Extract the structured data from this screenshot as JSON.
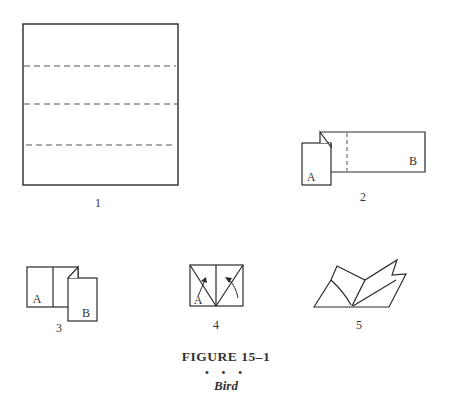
{
  "figure": {
    "title": "FIGURE 15–1",
    "separator": "• • •",
    "subtitle": "Bird"
  },
  "steps": [
    {
      "number": "1",
      "labels": []
    },
    {
      "number": "2",
      "labels": [
        "A",
        "B"
      ]
    },
    {
      "number": "3",
      "labels": [
        "A",
        "B"
      ]
    },
    {
      "number": "4",
      "labels": [
        "A"
      ]
    },
    {
      "number": "5",
      "labels": []
    }
  ],
  "colors": {
    "line": "#2a2a2a",
    "dash": "#555555",
    "background": "#ffffff"
  }
}
